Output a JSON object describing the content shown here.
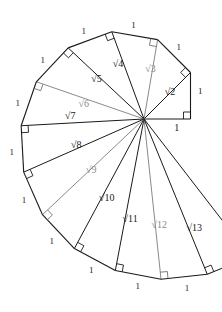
{
  "figure": {
    "center": {
      "x": 144,
      "y": 119
    },
    "scale_px_per_unit": 46.5,
    "colors": {
      "ink": "#1a1a1a",
      "gray": "#8a8a8a",
      "background": "#ffffff"
    },
    "unit_label": "1",
    "unit_label_count": 13,
    "right_angle_marker_count": 13,
    "hypotenuses": [
      {
        "index": 1,
        "label": "1",
        "value": 1,
        "color": "ink",
        "shown_as_spoke": true
      },
      {
        "index": 2,
        "label": "√2",
        "value": 1.414,
        "color": "ink",
        "shown_as_spoke": true
      },
      {
        "index": 3,
        "label": "√3",
        "value": 1.732,
        "color": "gray",
        "shown_as_spoke": true
      },
      {
        "index": 4,
        "label": "√4",
        "value": 2.0,
        "color": "ink",
        "shown_as_spoke": true
      },
      {
        "index": 5,
        "label": "√5",
        "value": 2.236,
        "color": "ink",
        "shown_as_spoke": true
      },
      {
        "index": 6,
        "label": "√6",
        "value": 2.449,
        "color": "gray",
        "shown_as_spoke": true
      },
      {
        "index": 7,
        "label": "√7",
        "value": 2.646,
        "color": "ink",
        "shown_as_spoke": true
      },
      {
        "index": 8,
        "label": "√8",
        "value": 2.828,
        "color": "ink",
        "shown_as_spoke": true
      },
      {
        "index": 9,
        "label": "√9",
        "value": 3.0,
        "color": "gray",
        "shown_as_spoke": true
      },
      {
        "index": 10,
        "label": "√10",
        "value": 3.162,
        "color": "ink",
        "shown_as_spoke": true
      },
      {
        "index": 11,
        "label": "√11",
        "value": 3.317,
        "color": "ink",
        "shown_as_spoke": true
      },
      {
        "index": 12,
        "label": "√12",
        "value": 3.464,
        "color": "gray",
        "shown_as_spoke": true
      },
      {
        "index": 13,
        "label": "√13",
        "value": 3.606,
        "color": "ink",
        "shown_as_spoke": false
      }
    ],
    "unit_labels": [
      {
        "for_triangle": 1,
        "text": "1"
      },
      {
        "for_triangle": 2,
        "text": "1"
      },
      {
        "for_triangle": 3,
        "text": "1"
      },
      {
        "for_triangle": 4,
        "text": "1"
      },
      {
        "for_triangle": 5,
        "text": "1"
      },
      {
        "for_triangle": 6,
        "text": "1"
      },
      {
        "for_triangle": 7,
        "text": "1"
      },
      {
        "for_triangle": 8,
        "text": "1"
      },
      {
        "for_triangle": 9,
        "text": "1"
      },
      {
        "for_triangle": 10,
        "text": "1"
      },
      {
        "for_triangle": 11,
        "text": "1"
      },
      {
        "for_triangle": 12,
        "text": "1"
      },
      {
        "for_triangle": 13,
        "text": "1"
      }
    ]
  }
}
